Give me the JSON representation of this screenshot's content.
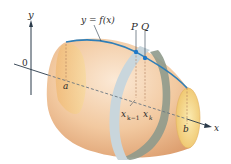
{
  "figure": {
    "type": "surface-of-revolution",
    "labels": {
      "y_axis": "y",
      "origin": "0",
      "curve": "y = f(x)",
      "point_p": "P",
      "point_q": "Q",
      "a": "a",
      "b": "b",
      "x_prev": "x",
      "x_prev_sub": "k−1",
      "x_k": "x",
      "x_k_sub": "k",
      "x_axis": "x"
    },
    "colors": {
      "surface_light": "#f7dcc0",
      "surface_mid": "#eeba8e",
      "surface_dark": "#d99a6c",
      "end_cap": "#f3d27a",
      "curve": "#2f7fb8",
      "point": "#1f78c8",
      "band_front": "#c9d6dc",
      "band_back": "#8f9a8c",
      "axis": "#2a3a4a"
    }
  }
}
